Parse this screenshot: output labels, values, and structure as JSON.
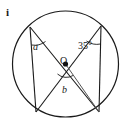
{
  "figure": {
    "part_label": "i",
    "center_label": "O",
    "labels": {
      "angle_a": "a",
      "angle_b": "b",
      "angle_35": "35°"
    },
    "colors": {
      "stroke": "#1a1a1a",
      "background": "#ffffff",
      "center_dot": "#111111"
    },
    "geometry": {
      "circle": {
        "cx": 65.5,
        "cy": 64,
        "r": 53
      },
      "center_point": {
        "x": 65.5,
        "y": 64
      },
      "points": {
        "top_left": {
          "x": 30,
          "y": 27
        },
        "top_right": {
          "x": 101,
          "y": 26
        },
        "bottom_left": {
          "x": 36,
          "y": 112
        },
        "bottom_right": {
          "x": 99,
          "y": 112
        }
      },
      "chords": [
        {
          "name": "diameter-top-left-to-bottom-right",
          "from": "top_left",
          "to": "bottom_right"
        },
        {
          "name": "diameter-top-right-to-bottom-left",
          "from": "top_right",
          "to": "bottom_left"
        },
        {
          "name": "left-vertical-chord",
          "from": "top_left",
          "to": "bottom_left"
        },
        {
          "name": "right-vertical-chord",
          "from": "top_right",
          "to": "bottom_right"
        },
        {
          "name": "chord-center-to-bottom-right",
          "from": "center_point",
          "to": "bottom_right"
        }
      ],
      "angle_arcs": [
        {
          "name": "arc-a",
          "at": "top_left"
        },
        {
          "name": "arc-35",
          "at": "top_right"
        },
        {
          "name": "arc-b",
          "at": "center_point"
        }
      ]
    }
  }
}
